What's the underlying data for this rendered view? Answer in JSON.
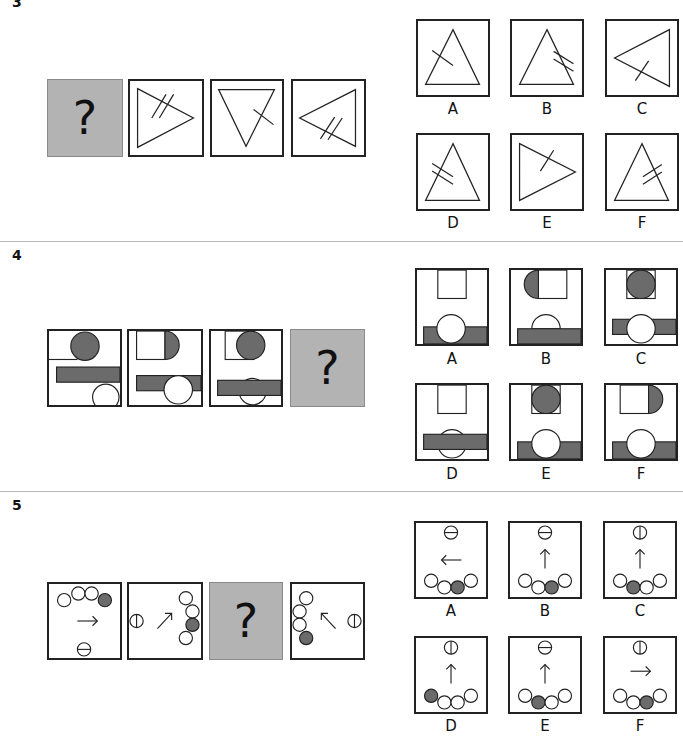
{
  "questions": [
    {
      "number": "3",
      "sequence": [
        {
          "type": "unknown",
          "label": "?"
        },
        {
          "type": "triangle",
          "orientation": "right",
          "marks": 2
        },
        {
          "type": "triangle",
          "orientation": "down",
          "marks": 1
        },
        {
          "type": "triangle",
          "orientation": "left",
          "marks": 2
        }
      ],
      "options": [
        {
          "label": "A",
          "orientation": "up",
          "marks": 1,
          "mark_side": "left"
        },
        {
          "label": "B",
          "orientation": "up",
          "marks": 2,
          "mark_side": "right"
        },
        {
          "label": "C",
          "orientation": "left",
          "marks": 1,
          "mark_side": "bottom"
        },
        {
          "label": "D",
          "orientation": "up",
          "marks": 2,
          "mark_side": "left"
        },
        {
          "label": "E",
          "orientation": "right",
          "marks": 1,
          "mark_side": "top"
        },
        {
          "label": "F",
          "orientation": "up",
          "marks": 2,
          "mark_side": "right"
        }
      ]
    },
    {
      "number": "4",
      "sequence": [
        {
          "type": "figure",
          "index": 1
        },
        {
          "type": "figure",
          "index": 2
        },
        {
          "type": "figure",
          "index": 3
        },
        {
          "type": "unknown",
          "label": "?"
        }
      ],
      "options": [
        {
          "label": "A"
        },
        {
          "label": "B"
        },
        {
          "label": "C"
        },
        {
          "label": "D"
        },
        {
          "label": "E"
        },
        {
          "label": "F"
        }
      ]
    },
    {
      "number": "5",
      "sequence": [
        {
          "type": "figure",
          "arrow": "right"
        },
        {
          "type": "figure",
          "arrow": "up-right"
        },
        {
          "type": "unknown",
          "label": "?"
        },
        {
          "type": "figure",
          "arrow": "up-left"
        }
      ],
      "options": [
        {
          "label": "A",
          "arrow": "left"
        },
        {
          "label": "B",
          "arrow": "up"
        },
        {
          "label": "C",
          "arrow": "up"
        },
        {
          "label": "D",
          "arrow": "up"
        },
        {
          "label": "E",
          "arrow": "up"
        },
        {
          "label": "F",
          "arrow": "right"
        }
      ]
    }
  ],
  "colors": {
    "fill_gray": "#6b6b6b",
    "unknown_box": "#b3b3b3",
    "stroke": "#222222",
    "divider": "#b8b8b8"
  }
}
